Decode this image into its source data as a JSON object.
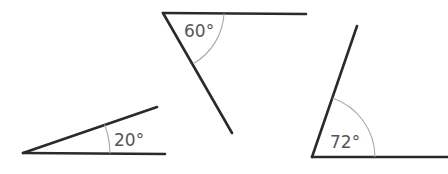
{
  "figure": {
    "angles": [
      {
        "id": "angle-20",
        "label": "20°",
        "degrees": 20,
        "vertex": [
          23,
          153
        ],
        "ray_a_end": [
          165,
          154
        ],
        "ray_b_end": [
          157,
          107
        ],
        "arc_path": "M 110 153.5 A 87 87 0 0 0 104.6 123",
        "label_pos": [
          113,
          145
        ]
      },
      {
        "id": "angle-60",
        "label": "60°",
        "degrees": 60,
        "vertex": [
          163,
          13
        ],
        "ray_a_end": [
          306,
          14
        ],
        "ray_b_end": [
          232,
          133
        ],
        "arc_path": "M 224 13.5 A 61 61 0 0 1 193.5 64",
        "label_pos": [
          172,
          36
        ]
      },
      {
        "id": "angle-72",
        "label": "72°",
        "degrees": 72,
        "vertex": [
          312,
          157
        ],
        "ray_a_end": [
          448,
          157
        ],
        "ray_b_end": [
          357,
          26
        ],
        "arc_path": "M 375 157 A 63 63 0 0 0 331.5 97",
        "label_pos": [
          317,
          147
        ]
      }
    ],
    "colors": {
      "ray": "#2a2a2a",
      "arc": "#a8a8a8",
      "label": "#555555"
    }
  }
}
